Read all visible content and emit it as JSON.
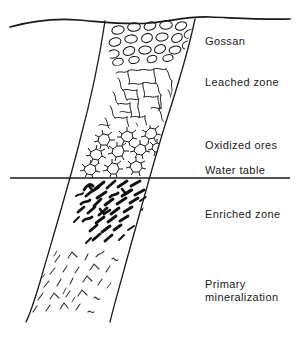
{
  "figure": {
    "kind": "geological-cross-section",
    "title_visible": false,
    "background_color": "#ffffff",
    "ink_color": "#1a1a1a",
    "width": 298,
    "height": 337
  },
  "lines": {
    "ground_surface": {
      "name": "ground-surface-line",
      "style": "wavy",
      "stroke_width": 1.6
    },
    "water_table": {
      "name": "water-table-line",
      "style": "straight-horizontal",
      "stroke_width": 1.4,
      "y": 178
    }
  },
  "orebody": {
    "name": "ore-vein-body",
    "description": "dipping tabular vein",
    "stroke_width": 1.2
  },
  "zones": [
    {
      "id": "gossan",
      "label": "Gossan",
      "label_x": 205,
      "label_y": 35,
      "texture": "oval-clasts"
    },
    {
      "id": "leached",
      "label": "Leached zone",
      "label_x": 205,
      "label_y": 76,
      "texture": "wiggly-cracks"
    },
    {
      "id": "oxidized",
      "label": "Oxidized ores",
      "label_x": 205,
      "label_y": 139,
      "texture": "spiky-stars"
    },
    {
      "id": "watertable",
      "label": "Water table",
      "label_x": 205,
      "label_y": 164,
      "texture": "none"
    },
    {
      "id": "enriched",
      "label": "Enriched zone",
      "label_x": 205,
      "label_y": 208,
      "texture": "thick-dashes"
    },
    {
      "id": "primary",
      "label": "Primary\nmineralization",
      "label_x": 205,
      "label_y": 278,
      "texture": "thin-sparse-strokes"
    }
  ]
}
